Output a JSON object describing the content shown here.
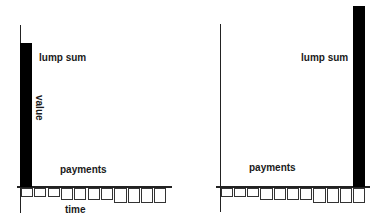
{
  "diagram": {
    "left": {
      "lump_sum_label": "lump sum",
      "value_label": "value",
      "payments_label": "payments",
      "time_label": "time",
      "lump_sum_position": "start",
      "payments_count": 11
    },
    "right": {
      "lump_sum_label": "lump sum",
      "payments_label": "payments",
      "lump_sum_position": "end",
      "payments_count": 11
    },
    "colors": {
      "bar": "#000000",
      "line": "#222222",
      "background": "#ffffff"
    }
  }
}
